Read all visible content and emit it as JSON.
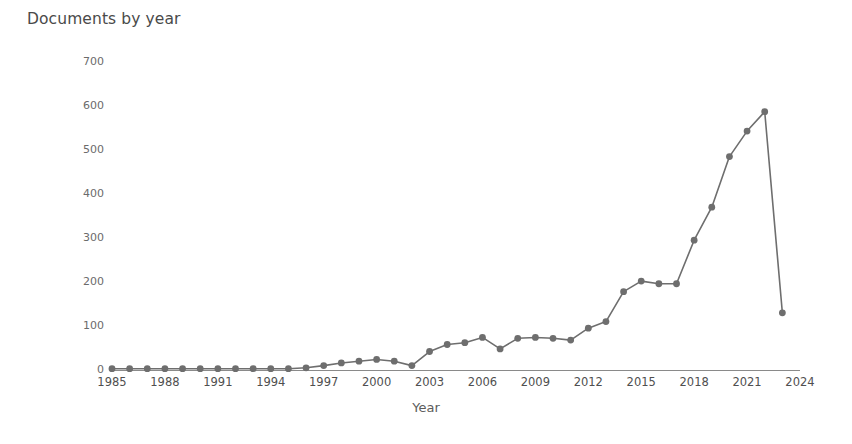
{
  "chart_data": {
    "type": "line",
    "title": "Documents by year",
    "xlabel": "Year",
    "ylabel": "Documents",
    "grid": false,
    "legend": false,
    "legend_position": "none",
    "line_color": "#6e6e6e",
    "marker": "circle",
    "xlim": [
      1985,
      2024
    ],
    "ylim": [
      0,
      700
    ],
    "ytick_labels": [
      "700",
      "600",
      "500",
      "400",
      "300",
      "200",
      "100",
      "0"
    ],
    "ytick_values": [
      700,
      600,
      500,
      400,
      300,
      200,
      100,
      0
    ],
    "xtick_labels": [
      "1985",
      "1988",
      "1991",
      "1994",
      "1997",
      "2000",
      "2003",
      "2006",
      "2009",
      "2012",
      "2015",
      "2018",
      "2021",
      "2024"
    ],
    "xtick_values": [
      1985,
      1988,
      1991,
      1994,
      1997,
      2000,
      2003,
      2006,
      2009,
      2012,
      2015,
      2018,
      2021,
      2024
    ],
    "x": [
      1985,
      1986,
      1987,
      1988,
      1989,
      1990,
      1991,
      1992,
      1993,
      1994,
      1995,
      1996,
      1997,
      1998,
      1999,
      2000,
      2001,
      2002,
      2003,
      2004,
      2005,
      2006,
      2007,
      2008,
      2009,
      2010,
      2011,
      2012,
      2013,
      2014,
      2015,
      2016,
      2017,
      2018,
      2019,
      2020,
      2021,
      2022,
      2023
    ],
    "values": [
      3,
      3,
      3,
      3,
      3,
      3,
      3,
      3,
      3,
      3,
      3,
      5,
      10,
      16,
      20,
      24,
      20,
      10,
      42,
      58,
      62,
      74,
      48,
      72,
      74,
      72,
      68,
      95,
      110,
      178,
      202,
      196,
      196,
      295,
      370,
      485,
      543,
      587,
      130
    ],
    "series": [
      {
        "name": "Documents",
        "values": [
          3,
          3,
          3,
          3,
          3,
          3,
          3,
          3,
          3,
          3,
          3,
          5,
          10,
          16,
          20,
          24,
          20,
          10,
          42,
          58,
          62,
          74,
          48,
          72,
          74,
          72,
          68,
          95,
          110,
          178,
          202,
          196,
          196,
          295,
          370,
          485,
          543,
          587,
          130
        ]
      }
    ]
  }
}
